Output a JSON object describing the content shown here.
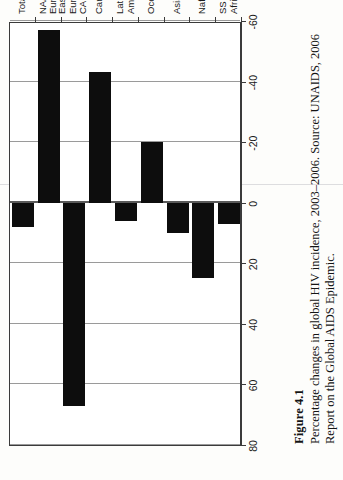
{
  "figure": {
    "number_label": "Figure 4.1",
    "caption": "Percentage changes in global HIV incidence, 2003–2006. Source: UNAIDS, 2006 Report on the Global AIDS Epidemic."
  },
  "chart_data": {
    "type": "bar",
    "orientation": "horizontal",
    "title": "",
    "xlabel": "",
    "ylabel": "",
    "categories": [
      "SS Africa",
      "Naf/ME",
      "Asia",
      "Oceania",
      "Latin\nAmerica",
      "Caribbean",
      "Eastern\nEurope/\nCA",
      "NA/\nEuro",
      "Total"
    ],
    "values": [
      7,
      25,
      10,
      -20,
      6,
      -43,
      67,
      -57,
      8
    ],
    "value_axis_ticks": [
      80,
      60,
      40,
      20,
      0,
      -20,
      -40,
      -60
    ],
    "value_axis_tick_labels": [
      "80",
      "60",
      "40",
      "20",
      "0",
      "-20",
      "-40",
      "-60"
    ],
    "ylim": [
      -60,
      80
    ],
    "grid": true,
    "legend": null,
    "bar_color": "#0d0d0d",
    "axis_color": "#3b3b3b",
    "grid_color": "#9a9a9a"
  }
}
